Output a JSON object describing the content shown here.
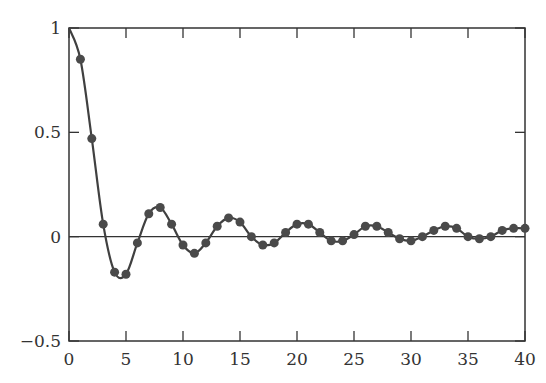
{
  "chart_data": {
    "type": "line",
    "title": "",
    "xlabel": "",
    "ylabel": "",
    "xlim": [
      0,
      40
    ],
    "ylim": [
      -0.5,
      1
    ],
    "grid": false,
    "legend": null,
    "x_ticks": [
      "0",
      "5",
      "10",
      "15",
      "20",
      "25",
      "30",
      "35",
      "40"
    ],
    "y_ticks": [
      "-0.5",
      "0",
      "0.5",
      "1"
    ],
    "series": [
      {
        "name": "samples",
        "marker": "circle",
        "x": [
          0,
          1,
          2,
          3,
          4,
          5,
          6,
          7,
          8,
          9,
          10,
          11,
          12,
          13,
          14,
          15,
          16,
          17,
          18,
          19,
          20,
          21,
          22,
          23,
          24,
          25,
          26,
          27,
          28,
          29,
          30,
          31,
          32,
          33,
          34,
          35,
          36,
          37,
          38,
          39,
          40
        ],
        "values": [
          1.0,
          0.85,
          0.47,
          0.06,
          -0.17,
          -0.18,
          -0.03,
          0.11,
          0.14,
          0.06,
          -0.04,
          -0.08,
          -0.03,
          0.05,
          0.09,
          0.07,
          0.0,
          -0.04,
          -0.03,
          0.02,
          0.06,
          0.06,
          0.02,
          -0.02,
          -0.02,
          0.01,
          0.05,
          0.05,
          0.02,
          -0.01,
          -0.02,
          0.0,
          0.03,
          0.05,
          0.04,
          0.0,
          -0.01,
          0.0,
          0.03,
          0.04,
          0.04
        ]
      }
    ],
    "colors": {
      "line": "#404040",
      "marker": "#4a4a4a",
      "axis": "#333333"
    }
  }
}
